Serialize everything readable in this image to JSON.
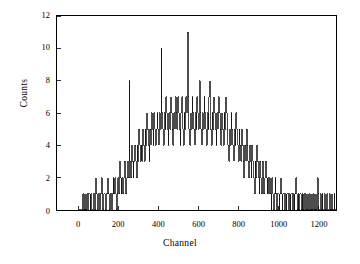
{
  "figure": {
    "background_color": "#ffffff",
    "foreground_color": "#000000",
    "line_color": "#000000"
  },
  "axis_labels": {
    "x": "Channel",
    "y": "Counts"
  },
  "ticks": {
    "x": [
      "0",
      "200",
      "400",
      "600",
      "800",
      "1000",
      "1200"
    ],
    "y": [
      "0",
      "2",
      "4",
      "6",
      "8",
      "10",
      "12"
    ]
  },
  "chart_data": {
    "type": "line",
    "title": "",
    "subtitle": "",
    "xlabel": "Channel",
    "ylabel": "Counts",
    "xlim": [
      -110,
      1290
    ],
    "ylim": [
      0,
      12
    ],
    "xticks": [
      0,
      200,
      400,
      600,
      800,
      1000,
      1200
    ],
    "yticks": [
      0,
      2,
      4,
      6,
      8,
      10,
      12
    ],
    "grid": false,
    "legend": null,
    "legend_position": "none",
    "tick_direction": "in",
    "frame": "box",
    "annotations": [],
    "series": [
      {
        "name": "counts",
        "x_start": 0,
        "x_step": 4,
        "x_end": 1020,
        "values": [
          0,
          0,
          0,
          0,
          0,
          1,
          0,
          1,
          0,
          0,
          1,
          0,
          1,
          1,
          0,
          1,
          0,
          0,
          1,
          1,
          0,
          2,
          1,
          0,
          1,
          1,
          0,
          1,
          2,
          1,
          0,
          1,
          1,
          0,
          1,
          1,
          2,
          1,
          0,
          1,
          1,
          0,
          1,
          2,
          1,
          2,
          1,
          0,
          1,
          2,
          1,
          3,
          2,
          1,
          2,
          1,
          2,
          3,
          2,
          1,
          2,
          3,
          2,
          8,
          3,
          2,
          4,
          3,
          2,
          3,
          4,
          3,
          2,
          4,
          3,
          5,
          4,
          3,
          4,
          3,
          5,
          4,
          3,
          5,
          4,
          6,
          5,
          4,
          3,
          5,
          4,
          6,
          5,
          4,
          6,
          5,
          4,
          5,
          6,
          5,
          4,
          6,
          5,
          10,
          6,
          5,
          4,
          6,
          5,
          7,
          6,
          5,
          4,
          6,
          5,
          7,
          6,
          5,
          4,
          6,
          5,
          7,
          6,
          5,
          7,
          6,
          5,
          4,
          6,
          7,
          5,
          4,
          6,
          5,
          7,
          6,
          11,
          7,
          5,
          4,
          6,
          5,
          7,
          6,
          5,
          4,
          6,
          5,
          7,
          6,
          5,
          8,
          6,
          5,
          4,
          6,
          5,
          7,
          6,
          5,
          4,
          6,
          5,
          7,
          8,
          5,
          4,
          6,
          5,
          7,
          6,
          5,
          4,
          6,
          5,
          7,
          6,
          5,
          4,
          6,
          5,
          4,
          6,
          5,
          7,
          6,
          5,
          4,
          3,
          5,
          4,
          6,
          5,
          4,
          3,
          5,
          4,
          6,
          5,
          4,
          3,
          5,
          4,
          3,
          5,
          4,
          3,
          2,
          4,
          3,
          5,
          4,
          3,
          2,
          4,
          3,
          2,
          4,
          3,
          2,
          1,
          3,
          2,
          4,
          3,
          2,
          1,
          3,
          2,
          1,
          3,
          2,
          1,
          2,
          3,
          2,
          1,
          2,
          1,
          2,
          1,
          0,
          2,
          1,
          0,
          1,
          2,
          1,
          0,
          1,
          1,
          0,
          1,
          2,
          1,
          0,
          1,
          1,
          0,
          1,
          0,
          1,
          1,
          0,
          1,
          0,
          1,
          1,
          0,
          1,
          0,
          1,
          2,
          1,
          0,
          1,
          0,
          1,
          1,
          0,
          1,
          0,
          1,
          0,
          1,
          0,
          0,
          1,
          0,
          1,
          0,
          0,
          1,
          0,
          1,
          0,
          0,
          1,
          0,
          2,
          1,
          0,
          0,
          1,
          0,
          1,
          0,
          0,
          1,
          0,
          0,
          1,
          0,
          0,
          1,
          0,
          0,
          1,
          0,
          0,
          1,
          0,
          0,
          0,
          1,
          0,
          0,
          0,
          1,
          0,
          0,
          0,
          0,
          1,
          0,
          0,
          0,
          0,
          1,
          0,
          0,
          0,
          0,
          1,
          0,
          0,
          0,
          0,
          0,
          1,
          0,
          0,
          0,
          0,
          0,
          0,
          1,
          0,
          0,
          0,
          0,
          0,
          0,
          0,
          0,
          0,
          0,
          0,
          0,
          0,
          0,
          0,
          0,
          0,
          0,
          0,
          0,
          0,
          0,
          0,
          0,
          0,
          0,
          0,
          0,
          0,
          0,
          0,
          0,
          0,
          0,
          0,
          0,
          0,
          0,
          0,
          0,
          0,
          0,
          0,
          0,
          0,
          0,
          0,
          0,
          0,
          0,
          0,
          0,
          0,
          0,
          0,
          0,
          0,
          0,
          0,
          0,
          0,
          0,
          0,
          0,
          0,
          0,
          0,
          0,
          0,
          0,
          0,
          0,
          0,
          0,
          0,
          0,
          0,
          0,
          0,
          0,
          0,
          0,
          0,
          0,
          0,
          0,
          0,
          0,
          0,
          0,
          0,
          0,
          0,
          0,
          0,
          0,
          0,
          0,
          0,
          0,
          0,
          0,
          0,
          0,
          0,
          0,
          0,
          0,
          0,
          0,
          0,
          0,
          0,
          0,
          0,
          0,
          0,
          0,
          0,
          0,
          0,
          0,
          0,
          0,
          0,
          0,
          0,
          0,
          0,
          0,
          0,
          0,
          0,
          0,
          0,
          0,
          0,
          0,
          0,
          0,
          0,
          0,
          0,
          0,
          0,
          0,
          0,
          0,
          0
        ]
      }
    ],
    "peak": {
      "channel": 192,
      "counts": 11
    },
    "data_start_channel": 20,
    "data_end_channel": 1020,
    "spike_region_end_channel": 580
  },
  "geometry": {
    "plot_left_px": 56,
    "plot_top_px": 15,
    "plot_width_px": 281,
    "plot_height_px": 196
  }
}
